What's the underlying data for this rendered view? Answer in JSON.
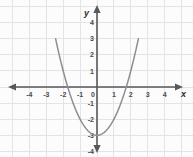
{
  "chart_data": {
    "type": "line",
    "title": "",
    "subtitle": "",
    "equation": "y = x^2 - 3",
    "xlabel": "x",
    "ylabel": "y",
    "xlim": [
      -4.8,
      4.8
    ],
    "ylim": [
      -4.4,
      4.4
    ],
    "xticks": [
      -4,
      -3,
      -2,
      -1,
      0,
      1,
      2,
      3,
      4
    ],
    "yticks": [
      4,
      3,
      2,
      1,
      0,
      -1,
      -2,
      -3,
      -4
    ],
    "xtick_labels": [
      "-4",
      "-3",
      "-2",
      "-1",
      "0",
      "1",
      "2",
      "3",
      "4"
    ],
    "ytick_labels": [
      "4",
      "3",
      "2",
      "1",
      "0",
      "-1",
      "-2",
      "-3",
      "-4"
    ],
    "grid": true,
    "legend": "none",
    "vertex": [
      0,
      -3
    ],
    "x_intercepts": [
      -1.73,
      1.73
    ],
    "y_intercept": -3,
    "x_domain_drawn": [
      -2.45,
      2.45
    ],
    "series": [
      {
        "name": "parabola",
        "color": "#8e8e93",
        "x": [
          -2.45,
          -2.2,
          -2.0,
          -1.73,
          -1.5,
          -1.25,
          -1.0,
          -0.75,
          -0.5,
          -0.25,
          0,
          0.25,
          0.5,
          0.75,
          1.0,
          1.25,
          1.5,
          1.73,
          2.0,
          2.2,
          2.45
        ],
        "values": [
          3.0,
          1.84,
          1.0,
          0.0,
          -0.75,
          -1.44,
          -2.0,
          -2.44,
          -2.75,
          -2.94,
          -3.0,
          -2.94,
          -2.75,
          -2.44,
          -2.0,
          -1.44,
          -0.75,
          0.0,
          1.0,
          1.84,
          3.0
        ]
      }
    ]
  },
  "axes": {
    "x_axis_name": "x",
    "y_axis_name": "y",
    "axis_color": "#58585c",
    "grid_color": "#e4e4e6",
    "background_color": "#fcfcfd",
    "curve_color": "#8e8e93"
  }
}
